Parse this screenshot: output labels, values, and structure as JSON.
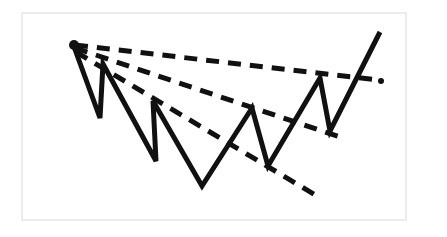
{
  "figure": {
    "background_color": "#ffffff",
    "frame": {
      "x": 21,
      "y": 12,
      "width": 386,
      "height": 209,
      "border_color": "#ececec",
      "border_width": 2
    }
  },
  "chart_data": {
    "type": "line",
    "title": "",
    "subtitle": "",
    "xlabel": "",
    "ylabel": "",
    "grid": false,
    "legend": "none",
    "axis_visible": false,
    "tick_labels": [],
    "annotations": [],
    "xlim": [
      21,
      407
    ],
    "ylim": [
      12,
      221
    ],
    "y_axis_inverted": true,
    "series": [
      {
        "name": "price-zigzag",
        "type": "line",
        "style": "solid",
        "color": "#111111",
        "width": 5,
        "points": [
          [
            73,
            44
          ],
          [
            100,
            118
          ],
          [
            103,
            64
          ],
          [
            156,
            161
          ],
          [
            153,
            101
          ],
          [
            202,
            186
          ],
          [
            252,
            108
          ],
          [
            268,
            166
          ],
          [
            320,
            78
          ],
          [
            330,
            131
          ],
          [
            380,
            32
          ]
        ]
      },
      {
        "name": "upper-trendline",
        "type": "line",
        "style": "dashed",
        "color": "#111111",
        "width": 5,
        "dash": "13 9",
        "points": [
          [
            75,
            45
          ],
          [
            378,
            80
          ]
        ]
      },
      {
        "name": "middle-trendline",
        "type": "line",
        "style": "dashed",
        "color": "#111111",
        "width": 5,
        "dash": "13 9",
        "points": [
          [
            75,
            48
          ],
          [
            340,
            137
          ]
        ]
      },
      {
        "name": "lower-trendline",
        "type": "line",
        "style": "dashed",
        "color": "#111111",
        "width": 5,
        "dash": "13 9",
        "points": [
          [
            76,
            52
          ],
          [
            317,
            196
          ]
        ]
      }
    ],
    "markers": [
      {
        "name": "apex-marker",
        "x": 74,
        "y": 45,
        "size": 5,
        "color": "#111111"
      },
      {
        "name": "upper-trendline-terminal-dot",
        "x": 381,
        "y": 81,
        "size": 3,
        "color": "#111111"
      }
    ]
  }
}
